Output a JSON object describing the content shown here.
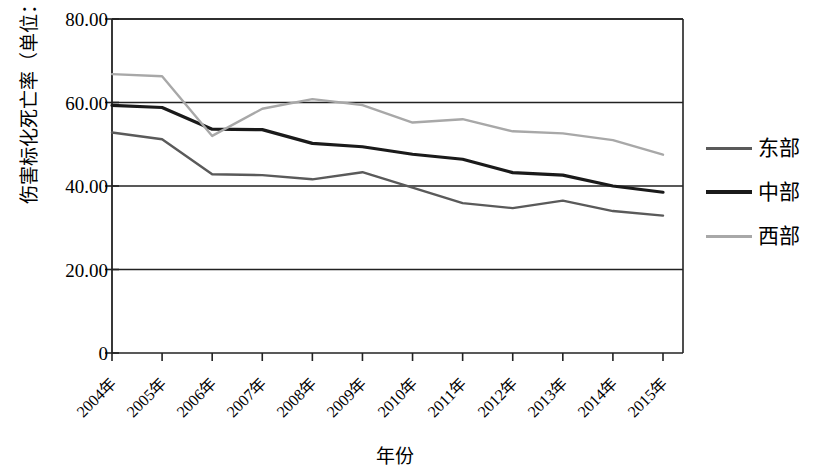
{
  "chart_data": {
    "type": "line",
    "title": "",
    "xlabel": "年份",
    "ylabel": "伤害标化死亡率（单位：1/10万）",
    "categories": [
      "2004年",
      "2005年",
      "2006年",
      "2007年",
      "2008年",
      "2009年",
      "2010年",
      "2011年",
      "2012年",
      "2013年",
      "2014年",
      "2015年"
    ],
    "x_values": [
      2004,
      2005,
      2006,
      2007,
      2008,
      2009,
      2010,
      2011,
      2012,
      2013,
      2014,
      2015
    ],
    "series": [
      {
        "name": "东部",
        "color": "#5a5a5a",
        "values": [
          52.8,
          51.2,
          42.8,
          42.6,
          41.6,
          43.3,
          39.6,
          35.9,
          34.7,
          36.5,
          34.0,
          32.9
        ]
      },
      {
        "name": "中部",
        "color": "#1a1a1a",
        "values": [
          59.3,
          58.8,
          53.6,
          53.5,
          50.2,
          49.4,
          47.6,
          46.4,
          43.2,
          42.6,
          40.0,
          38.5
        ]
      },
      {
        "name": "西部",
        "color": "#a8a8a8",
        "values": [
          66.8,
          66.3,
          52.0,
          58.5,
          60.8,
          59.4,
          55.2,
          56.0,
          53.1,
          52.6,
          51.0,
          47.5
        ]
      }
    ],
    "ylim": [
      0,
      80
    ],
    "yticks": [
      0,
      20,
      40,
      60,
      80
    ],
    "ytick_labels": [
      "0",
      "20.00",
      "40.00",
      "60.00",
      "80.00"
    ],
    "xlim": [
      2004,
      2015
    ],
    "grid": "horizontal",
    "legend_position": "right"
  },
  "legend": {
    "items": [
      {
        "label": "东部",
        "color": "#5a5a5a",
        "width": 3
      },
      {
        "label": "中部",
        "color": "#1a1a1a",
        "width": 4
      },
      {
        "label": "西部",
        "color": "#a8a8a8",
        "width": 3
      }
    ]
  }
}
